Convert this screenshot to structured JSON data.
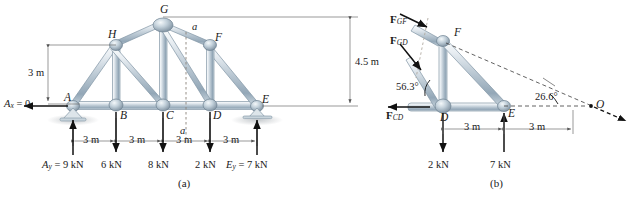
{
  "figure_a": {
    "caption": "(a)",
    "nodes": [
      {
        "id": "A",
        "label": "A",
        "x": 73,
        "y": 106
      },
      {
        "id": "B",
        "label": "B",
        "x": 116,
        "y": 106
      },
      {
        "id": "C",
        "label": "C",
        "x": 163,
        "y": 106
      },
      {
        "id": "D",
        "label": "D",
        "x": 210,
        "y": 106
      },
      {
        "id": "E",
        "label": "E",
        "x": 257,
        "y": 106
      },
      {
        "id": "F",
        "label": "F",
        "x": 210,
        "y": 45
      },
      {
        "id": "G",
        "label": "G",
        "x": 163,
        "y": 24
      },
      {
        "id": "H",
        "label": "H",
        "x": 116,
        "y": 45
      }
    ],
    "dimensions": {
      "height_left": "3 m",
      "height_right": "4.5 m",
      "bay_1": "3 m",
      "bay_2": "3 m",
      "bay_3": "3 m",
      "bay_4": "3 m"
    },
    "reactions": {
      "ax": "A",
      "ax_sub": "x",
      "ax_value": " = 0",
      "ay": "A",
      "ay_sub": "y",
      "ay_value": " = 9 kN",
      "ey": "E",
      "ey_sub": "y",
      "ey_value": " = 7 kN"
    },
    "loads": [
      {
        "at": "B",
        "label": "6 kN"
      },
      {
        "at": "C",
        "label": "8 kN"
      },
      {
        "at": "D",
        "label": "2 kN"
      }
    ],
    "section_line": {
      "top_label": "a",
      "bottom_label": "a"
    }
  },
  "figure_b": {
    "caption": "(b)",
    "nodes": [
      {
        "id": "D",
        "label": "D"
      },
      {
        "id": "E",
        "label": "E"
      },
      {
        "id": "F",
        "label": "F"
      },
      {
        "id": "O",
        "label": "O"
      }
    ],
    "forces": [
      {
        "name": "F",
        "sub": "GF"
      },
      {
        "name": "F",
        "sub": "GD"
      },
      {
        "name": "F",
        "sub": "CD"
      }
    ],
    "angles": {
      "at_d": "56.3°",
      "at_o": "26.6°"
    },
    "loads": [
      {
        "at": "D",
        "label": "2 kN"
      },
      {
        "at": "E",
        "label": "7 kN"
      }
    ],
    "dimensions": {
      "de": "3 m",
      "eo": "3 m"
    }
  },
  "colors": {
    "member_light": "#e3e9ee",
    "member_mid": "#b8c6d1",
    "member_dark": "#8fa3b3",
    "outline": "#7d8d9b",
    "ink": "#1a1a1a",
    "dim_line": "#6e6e6e",
    "dashed": "#3a3a3a",
    "shadow": "#c9cdd1"
  }
}
